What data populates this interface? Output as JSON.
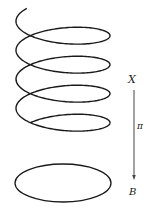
{
  "diagram": {
    "labels": {
      "total_space": "X",
      "base_space": "B",
      "projection": "π"
    },
    "helix": {
      "turns": 4,
      "center_x": 63,
      "radius_x": 47,
      "radius_y": 15,
      "start_y": 26,
      "pitch": 29,
      "stroke": "#1a1a1a",
      "stroke_width": 1.4
    },
    "base_circle": {
      "cx": 63,
      "cy": 183,
      "rx": 48,
      "ry": 19,
      "stroke": "#1a1a1a",
      "stroke_width": 1.3
    },
    "arrow": {
      "x": 134,
      "y1": 90,
      "y2": 180,
      "stroke": "#444444"
    }
  }
}
